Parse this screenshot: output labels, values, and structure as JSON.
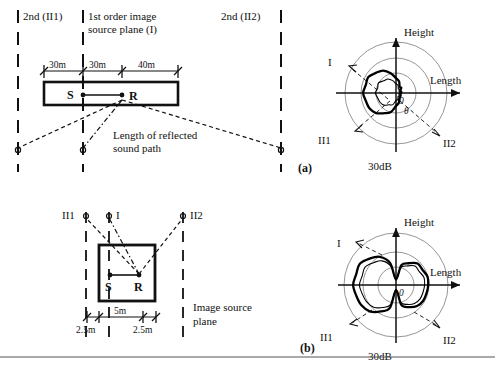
{
  "figure": {
    "type": "acoustics-image-source-diagram",
    "panels": [
      {
        "id": "a",
        "label": "(a)",
        "plan": {
          "plane_labels": {
            "left": "2nd (II1)",
            "center_line1": "1st order image",
            "center_line2": "source plane (I)",
            "right": "2nd (II2)"
          },
          "dimensions": [
            "30m",
            "30m",
            "40m"
          ],
          "source_label": "S",
          "receiver_label": "R",
          "annotation_line1": "Length of reflected",
          "annotation_line2": "sound path"
        },
        "polar": {
          "axis_vertical": "Height",
          "axis_horizontal": "Length",
          "scale_label": "30dB",
          "angle_label": "θ",
          "origin_label": "0",
          "order_labels": [
            "I",
            "II1",
            "II2"
          ]
        }
      },
      {
        "id": "b",
        "label": "(b)",
        "plan": {
          "plane_labels": {
            "left": "II1",
            "center": "I",
            "right": "II2"
          },
          "dimensions": [
            "2.5m",
            "5m",
            "2.5m"
          ],
          "source_label": "S",
          "receiver_label": "R",
          "annotation_line1": "Image source",
          "annotation_line2": "plane"
        },
        "polar": {
          "axis_vertical": "Height",
          "axis_horizontal": "Length",
          "scale_label": "30dB",
          "origin_label": "0",
          "order_labels": [
            "I",
            "II1",
            "II2"
          ]
        }
      }
    ]
  },
  "chart_data": [
    {
      "type": "line",
      "subtype": "polar",
      "title": "Reflected sound energy directivity - large room (a)",
      "xlabel": "Length",
      "ylabel": "Height",
      "scale_label": "30dB",
      "rings": [
        0.33,
        0.66,
        1.0
      ],
      "grid": true,
      "series": [
        {
          "name": "bold-lobe",
          "note": "Single large lobe directed toward negative Length (left), peak near 180 deg",
          "theta_deg": [
            0,
            15,
            30,
            45,
            60,
            75,
            90,
            105,
            120,
            135,
            150,
            165,
            180,
            195,
            210,
            225,
            240,
            255,
            270,
            285,
            300,
            315,
            330,
            345
          ],
          "r": [
            0.1,
            0.1,
            0.11,
            0.13,
            0.16,
            0.22,
            0.3,
            0.4,
            0.5,
            0.57,
            0.61,
            0.63,
            0.63,
            0.62,
            0.6,
            0.55,
            0.47,
            0.37,
            0.27,
            0.19,
            0.14,
            0.11,
            0.1,
            0.1
          ]
        },
        {
          "name": "thin-inner-lobe",
          "note": "Smaller inner contour, similar left-directed shape",
          "theta_deg": [
            0,
            15,
            30,
            45,
            60,
            75,
            90,
            105,
            120,
            135,
            150,
            165,
            180,
            195,
            210,
            225,
            240,
            255,
            270,
            285,
            300,
            315,
            330,
            345
          ],
          "r": [
            0.07,
            0.07,
            0.08,
            0.09,
            0.11,
            0.14,
            0.19,
            0.25,
            0.31,
            0.35,
            0.38,
            0.39,
            0.39,
            0.38,
            0.36,
            0.33,
            0.28,
            0.22,
            0.16,
            0.12,
            0.09,
            0.08,
            0.07,
            0.07
          ]
        }
      ]
    },
    {
      "type": "line",
      "subtype": "polar",
      "title": "Reflected sound energy directivity - small room (b)",
      "xlabel": "Length",
      "ylabel": "Height",
      "scale_label": "30dB",
      "rings": [
        0.33,
        0.66,
        1.0
      ],
      "grid": true,
      "series": [
        {
          "name": "bold-bilobe",
          "note": "Figure-eight pattern, left lobe larger than right, null along Height axis",
          "theta_deg": [
            0,
            15,
            30,
            45,
            60,
            75,
            90,
            105,
            120,
            135,
            150,
            165,
            180,
            195,
            210,
            225,
            240,
            255,
            270,
            285,
            300,
            315,
            330,
            345
          ],
          "r": [
            0.62,
            0.62,
            0.6,
            0.57,
            0.5,
            0.38,
            0.12,
            0.44,
            0.62,
            0.73,
            0.79,
            0.81,
            0.81,
            0.8,
            0.77,
            0.71,
            0.6,
            0.44,
            0.12,
            0.38,
            0.5,
            0.57,
            0.6,
            0.62
          ]
        },
        {
          "name": "thin-bilobe",
          "note": "Slightly smaller figure-eight contour",
          "theta_deg": [
            0,
            15,
            30,
            45,
            60,
            75,
            90,
            105,
            120,
            135,
            150,
            165,
            180,
            195,
            210,
            225,
            240,
            255,
            270,
            285,
            300,
            315,
            330,
            345
          ],
          "r": [
            0.55,
            0.55,
            0.53,
            0.5,
            0.44,
            0.33,
            0.1,
            0.37,
            0.53,
            0.62,
            0.67,
            0.69,
            0.69,
            0.68,
            0.65,
            0.6,
            0.51,
            0.37,
            0.1,
            0.33,
            0.44,
            0.5,
            0.53,
            0.55
          ]
        }
      ]
    }
  ]
}
